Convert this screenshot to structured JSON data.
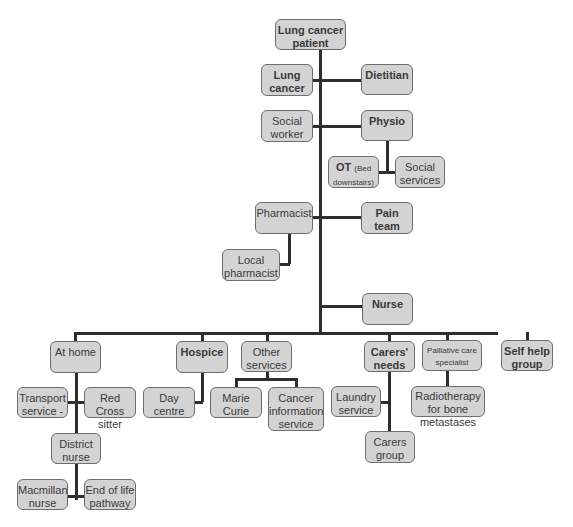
{
  "diagram": {
    "type": "tree",
    "root": "Lung cancer patient",
    "nodes": {
      "root": "Lung cancer patient",
      "lung_cancer": "Lung cancer",
      "dietitian": "Dietitian",
      "social_worker": "Social worker",
      "physio": "Physio",
      "ot_main": "OT",
      "ot_note": "(Bed downstairs)",
      "social_services": "Social services",
      "pharmacist": "Pharmacist",
      "pain_team": "Pain team",
      "local_pharmacist": "Local pharmacist",
      "nurse": "Nurse",
      "at_home": "At home",
      "hospice": "Hospice",
      "other_services": "Other services",
      "carers_needs": "Carers' needs",
      "palliative": "Palliative care specialist",
      "self_help": "Self help group",
      "transport": "Transport service -",
      "red_cross": "Red Cross sitter",
      "day_centre": "Day centre",
      "marie_curie": "Marie Curie",
      "cancer_info": "Cancer information service",
      "laundry": "Laundry service",
      "radiotherapy": "Radiotherapy for bone metastases",
      "carers_group": "Carers group",
      "district_nurse": "District nurse",
      "macmillan": "Macmillan nurse",
      "end_of_life": "End of life pathway"
    },
    "edges": [
      [
        "Lung cancer patient",
        "Lung cancer"
      ],
      [
        "Lung cancer patient",
        "Dietitian"
      ],
      [
        "Lung cancer patient",
        "Social worker"
      ],
      [
        "Lung cancer patient",
        "Physio"
      ],
      [
        "Physio",
        "OT (Bed downstairs)"
      ],
      [
        "Physio",
        "Social services"
      ],
      [
        "Lung cancer patient",
        "Pharmacist"
      ],
      [
        "Lung cancer patient",
        "Pain team"
      ],
      [
        "Pharmacist",
        "Local pharmacist"
      ],
      [
        "Lung cancer patient",
        "Nurse"
      ],
      [
        "Lung cancer patient",
        "At home"
      ],
      [
        "Lung cancer patient",
        "Hospice"
      ],
      [
        "Lung cancer patient",
        "Other services"
      ],
      [
        "Lung cancer patient",
        "Carers' needs"
      ],
      [
        "Lung cancer patient",
        "Palliative care specialist"
      ],
      [
        "Lung cancer patient",
        "Self help group"
      ],
      [
        "At home",
        "Transport service -"
      ],
      [
        "At home",
        "Red Cross sitter"
      ],
      [
        "At home",
        "District nurse"
      ],
      [
        "District nurse",
        "Macmillan nurse"
      ],
      [
        "District nurse",
        "End of life pathway"
      ],
      [
        "Hospice",
        "Day centre"
      ],
      [
        "Other services",
        "Marie Curie"
      ],
      [
        "Other services",
        "Cancer information service"
      ],
      [
        "Carers' needs",
        "Laundry service"
      ],
      [
        "Carers' needs",
        "Carers group"
      ],
      [
        "Palliative care specialist",
        "Radiotherapy for bone metastases"
      ]
    ]
  }
}
